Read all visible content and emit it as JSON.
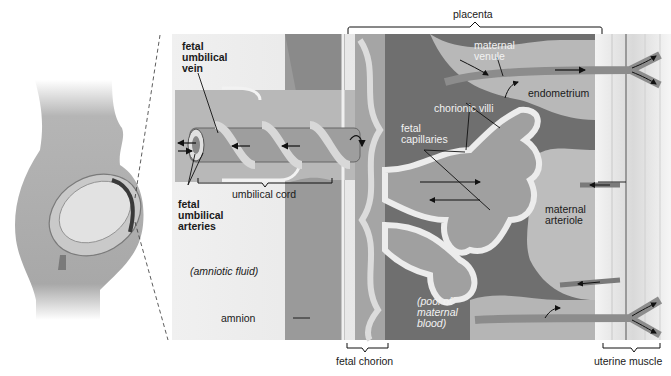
{
  "diagram": {
    "labels": {
      "placenta": "placenta",
      "fetal_umbilical_vein": "fetal\numbilical\nvein",
      "fetal_umbilical_arteries": "fetal\numbilical\narteries",
      "umbilical_cord": "umbilical cord",
      "amniotic_fluid": "(amniotic fluid)",
      "amnion": "amnion",
      "fetal_chorion": "fetal chorion",
      "maternal_venule": "maternal\nvenule",
      "endometrium": "endometrium",
      "chorionic_villi": "chorionic villi",
      "fetal_capillaries": "fetal\ncapillaries",
      "maternal_arteriole": "maternal\narteriole",
      "pool_of_maternal_blood": "(pool of\nmaternal\nblood)",
      "uterine_muscle": "uterine muscle"
    },
    "colors": {
      "amniotic_bg": "#e6e6e6",
      "cord_tissue": "#b0b0b0",
      "chorion_dark": "#8a8a8a",
      "maternal_pool": "#6a6a6a",
      "endometrium": "#c8c8c8",
      "villi_outline": "#e8e8e8",
      "muscle": "#ededed",
      "body_silhouette": "#a9a9a9",
      "line": "#1a1a1a"
    }
  }
}
